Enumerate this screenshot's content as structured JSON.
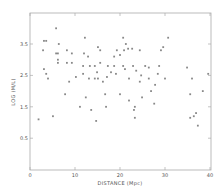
{
  "chart_data": {
    "type": "scatter",
    "title": "",
    "xlabel": "DISTANCE (Mpc)",
    "ylabel": "LOG (M/L)",
    "xlim": [
      0,
      40
    ],
    "ylim": [
      0.0,
      4.0
    ],
    "xticks": [
      0,
      10,
      20,
      30,
      40
    ],
    "yticks": [
      0.5,
      1.5,
      2.5,
      3.5
    ],
    "xtick_labels": [
      "0",
      "10",
      "20",
      "30",
      "40"
    ],
    "ytick_labels": [
      "0.5",
      "1.5",
      "2.5",
      "3.5"
    ],
    "grid": false,
    "legend": null,
    "marker_color": "#888888",
    "frame_color": "#aaaaaa",
    "series": [
      {
        "name": "galaxies",
        "points": [
          [
            5.8,
            4.0
          ],
          [
            3.1,
            3.6
          ],
          [
            3.6,
            3.6
          ],
          [
            6.4,
            3.5
          ],
          [
            2.9,
            3.3
          ],
          [
            12.2,
            3.7
          ],
          [
            20.7,
            3.7
          ],
          [
            21.3,
            3.5
          ],
          [
            15.1,
            3.4
          ],
          [
            30.7,
            3.7
          ],
          [
            29.1,
            3.3
          ],
          [
            29.6,
            3.4
          ],
          [
            20.9,
            3.3
          ],
          [
            21.8,
            3.35
          ],
          [
            22.7,
            3.35
          ],
          [
            8.2,
            3.3
          ],
          [
            5.8,
            3.2
          ],
          [
            6.2,
            3.2
          ],
          [
            9.3,
            3.2
          ],
          [
            12.9,
            3.1
          ],
          [
            15.6,
            3.3
          ],
          [
            19.3,
            3.3
          ],
          [
            24.4,
            3.3
          ],
          [
            18.7,
            3.1
          ],
          [
            20.0,
            3.15
          ],
          [
            12.0,
            3.2
          ],
          [
            6.2,
            3.0
          ],
          [
            6.2,
            2.9
          ],
          [
            8.2,
            2.9
          ],
          [
            9.3,
            2.9
          ],
          [
            11.8,
            2.8
          ],
          [
            13.3,
            2.8
          ],
          [
            14.4,
            2.8
          ],
          [
            15.6,
            2.9
          ],
          [
            17.3,
            2.8
          ],
          [
            18.7,
            2.8
          ],
          [
            20.7,
            2.8
          ],
          [
            22.9,
            2.8
          ],
          [
            25.6,
            2.8
          ],
          [
            26.4,
            2.75
          ],
          [
            28.7,
            2.8
          ],
          [
            34.9,
            2.75
          ],
          [
            3.1,
            2.7
          ],
          [
            4.0,
            2.4
          ],
          [
            3.6,
            2.55
          ],
          [
            11.8,
            2.55
          ],
          [
            13.1,
            2.4
          ],
          [
            14.9,
            2.6
          ],
          [
            17.1,
            2.45
          ],
          [
            19.1,
            2.55
          ],
          [
            21.1,
            2.7
          ],
          [
            23.6,
            2.65
          ],
          [
            24.7,
            2.5
          ],
          [
            26.4,
            2.4
          ],
          [
            28.4,
            2.55
          ],
          [
            8.7,
            2.3
          ],
          [
            10.2,
            2.45
          ],
          [
            14.4,
            2.4
          ],
          [
            15.1,
            2.4
          ],
          [
            16.2,
            2.3
          ],
          [
            18.0,
            2.6
          ],
          [
            22.0,
            2.4
          ],
          [
            24.4,
            2.3
          ],
          [
            27.8,
            2.2
          ],
          [
            30.0,
            2.4
          ],
          [
            36.0,
            2.4
          ],
          [
            39.6,
            2.55
          ],
          [
            7.8,
            1.9
          ],
          [
            12.4,
            1.8
          ],
          [
            16.7,
            1.9
          ],
          [
            20.0,
            1.9
          ],
          [
            22.0,
            1.7
          ],
          [
            24.9,
            1.8
          ],
          [
            26.9,
            2.0
          ],
          [
            35.6,
            1.9
          ],
          [
            38.4,
            2.0
          ],
          [
            11.1,
            1.5
          ],
          [
            13.6,
            1.4
          ],
          [
            16.9,
            1.5
          ],
          [
            23.3,
            1.5
          ],
          [
            27.6,
            1.6
          ],
          [
            23.1,
            1.4
          ],
          [
            36.4,
            1.2
          ],
          [
            1.9,
            1.1
          ],
          [
            5.1,
            1.2
          ],
          [
            14.7,
            1.05
          ],
          [
            23.3,
            1.15
          ],
          [
            35.6,
            1.15
          ],
          [
            36.9,
            1.3
          ],
          [
            37.3,
            0.9
          ]
        ]
      }
    ]
  },
  "plot": {
    "x_axis_title": "DISTANCE (Mpc)",
    "y_axis_title": "LOG (M/L)"
  }
}
